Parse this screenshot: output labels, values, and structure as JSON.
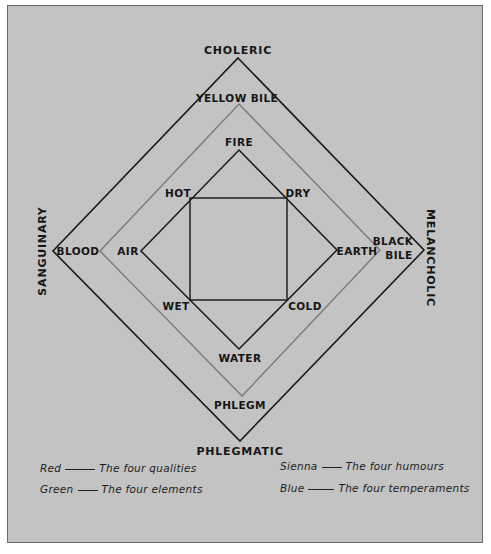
{
  "temperaments": {
    "top": "CHOLERIC",
    "left": "SANGUINARY",
    "right": "MELANCHOLIC",
    "bottom": "PHLEGMATIC"
  },
  "humours": {
    "top": "YELLOW BILE",
    "left": "BLOOD",
    "right_line1": "BLACK",
    "right_line2": "BILE",
    "bottom": "PHLEGM"
  },
  "elements": {
    "top": "FIRE",
    "left": "AIR",
    "right": "EARTH",
    "bottom": "WATER"
  },
  "qualities": {
    "top_left": "HOT",
    "top_right": "DRY",
    "bottom_left": "WET",
    "bottom_right": "COLD"
  },
  "legend": [
    {
      "color_name": "Red",
      "meaning": "The four qualities"
    },
    {
      "color_name": "Sienna",
      "meaning": "The four humours"
    },
    {
      "color_name": "Green",
      "meaning": "The four elements"
    },
    {
      "color_name": "Blue",
      "meaning": "The four temperaments"
    }
  ],
  "colors": {
    "paper": "#c3c3c3",
    "temperament_line": "#1a1a1a",
    "humour_line": "#7a7a7a",
    "element_line": "#1a1a1a",
    "quality_line": "#222222"
  }
}
